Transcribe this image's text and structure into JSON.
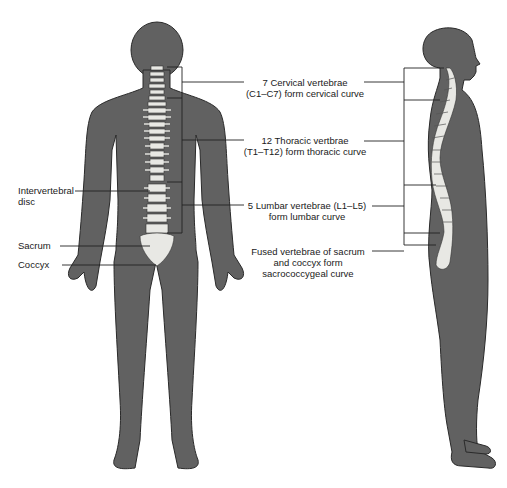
{
  "diagram": {
    "colors": {
      "body": "#616161",
      "outline": "#2a2a2a",
      "bone": "#e8e8e4",
      "line": "#222222",
      "text": "#1a1a1a"
    },
    "left_labels": [
      {
        "id": "intervertebral-disc",
        "lines": [
          "Intervertebral",
          "disc"
        ]
      },
      {
        "id": "sacrum",
        "lines": [
          "Sacrum"
        ]
      },
      {
        "id": "coccyx",
        "lines": [
          "Coccyx"
        ]
      }
    ],
    "center_labels": [
      {
        "id": "cervical",
        "lines": [
          "7 Cervical vertebrae",
          "(C1–C7) form cervical curve"
        ]
      },
      {
        "id": "thoracic",
        "lines": [
          "12 Thoracic vertbrae",
          "(T1–T12) form thoracic curve"
        ]
      },
      {
        "id": "lumbar",
        "lines": [
          "5 Lumbar vertebrae (L1–L5)",
          "form lumbar curve"
        ]
      },
      {
        "id": "sacrococcygeal",
        "lines": [
          "Fused vertebrae of sacrum",
          "and coccyx form",
          "sacrococcygeal curve"
        ]
      }
    ],
    "views": [
      {
        "id": "posterior-view",
        "description": "Back view of human body showing spine"
      },
      {
        "id": "lateral-view",
        "description": "Side view of human body showing spinal curves"
      }
    ]
  }
}
